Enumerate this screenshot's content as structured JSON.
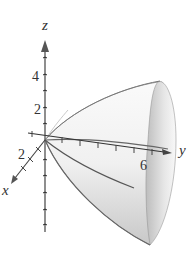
{
  "figure": {
    "axes": {
      "z": {
        "label": "z",
        "ticks": [
          {
            "value": "2"
          },
          {
            "value": "4"
          }
        ]
      },
      "x": {
        "label": "x",
        "ticks": [
          {
            "value": "2"
          }
        ]
      },
      "y": {
        "label": "y",
        "ticks": [
          {
            "value": "6"
          }
        ]
      }
    },
    "colors": {
      "surface_light": "#f4f4f4",
      "surface_dark": "#b8b8b8",
      "axis": "#444444",
      "curve": "#555555"
    }
  }
}
